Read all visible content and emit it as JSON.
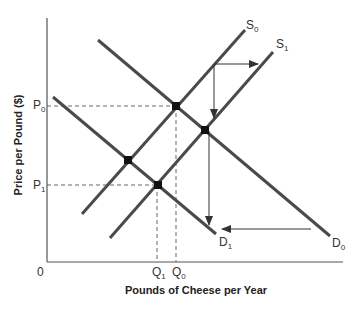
{
  "diagram": {
    "type": "supply-demand",
    "axes": {
      "origin_label": "0",
      "x_title": "Pounds of Cheese per Year",
      "y_title": "Price per Pound ($)"
    },
    "price_labels": [
      {
        "main": "P",
        "sub": "0"
      },
      {
        "main": "P",
        "sub": "1"
      }
    ],
    "quantity_labels": [
      {
        "main": "Q",
        "sub": "1"
      },
      {
        "main": "Q",
        "sub": "0"
      }
    ],
    "curves": [
      {
        "id": "S0",
        "main": "S",
        "sub": "0",
        "kind": "supply"
      },
      {
        "id": "S1",
        "main": "S",
        "sub": "1",
        "kind": "supply"
      },
      {
        "id": "D0",
        "main": "D",
        "sub": "0",
        "kind": "demand"
      },
      {
        "id": "D1",
        "main": "D",
        "sub": "1",
        "kind": "demand"
      }
    ],
    "equilibria": [
      {
        "curves": "S0-D0",
        "price": "P0",
        "quantity": "Q0"
      },
      {
        "curves": "S1-D0"
      },
      {
        "curves": "S0-D1"
      },
      {
        "curves": "S1-D1",
        "price": "P1",
        "quantity": "Q1"
      }
    ],
    "shift_arrows": [
      {
        "from": "S0",
        "to": "S1",
        "direction": "right"
      },
      {
        "from": "D0",
        "to": "D1",
        "direction": "left"
      },
      {
        "direction": "down"
      }
    ],
    "colors": {
      "curve": "#4a4a4a",
      "axis": "#555555",
      "dashed": "#666666",
      "point": "#111111"
    }
  }
}
